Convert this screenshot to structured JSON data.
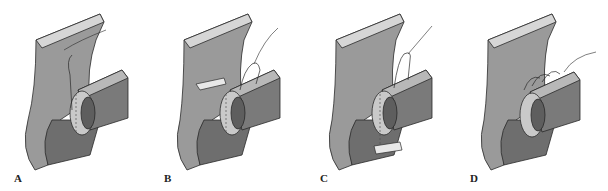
{
  "figure": {
    "panels": [
      {
        "id": "A",
        "label": "A",
        "description": "stoma ring adjacent to wall, suture from top"
      },
      {
        "id": "B",
        "label": "B",
        "description": "bolster placed on wall, suture loops through ring"
      },
      {
        "id": "C",
        "label": "C",
        "description": "bolster placed below ring, suture tied above"
      },
      {
        "id": "D",
        "label": "D",
        "description": "multiple suture loops over ring"
      }
    ],
    "colors": {
      "tissue": "#9a9a9a",
      "tissue_light": "#c4c4c4",
      "tissue_top": "#d6d6d6",
      "tube": "#7a7a7a",
      "tube_inner": "#5e5e5e",
      "ring": "#c9c9c9",
      "outline": "#2a2a2a"
    }
  }
}
